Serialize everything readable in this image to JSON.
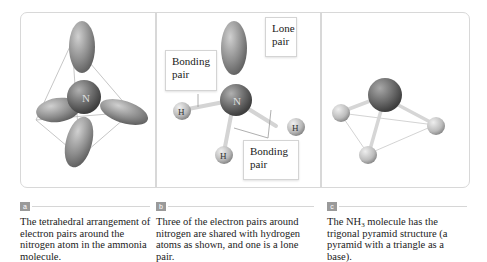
{
  "panels": [
    {
      "id": "a",
      "badge": "a",
      "caption": "The tetrahedral arrangement of electron pairs around the nitrogen atom in the ammonia molecule.",
      "atom_label": "N"
    },
    {
      "id": "b",
      "badge": "b",
      "caption": "Three of the electron pairs around nitrogen are shared with hydrogen atoms as shown, and one is a lone pair.",
      "atom_label": "N",
      "hydrogen_label": "H",
      "callouts": {
        "lone_pair": "Lone pair",
        "bonding_pair_top": "Bonding pair",
        "bonding_pair_bottom": "Bonding pair"
      }
    },
    {
      "id": "c",
      "badge": "c",
      "caption_pre": "The NH",
      "caption_sub": "3",
      "caption_post": " molecule has the trigonal pyramid structure (a pyramid with a triangle as a base)."
    }
  ],
  "colors": {
    "frame": "#d8d8d8",
    "orbital": "#8a8a8a",
    "atom": "#6e6e6e",
    "hydrogen": "#b8b8b8",
    "badge": "#9a9a9a"
  }
}
